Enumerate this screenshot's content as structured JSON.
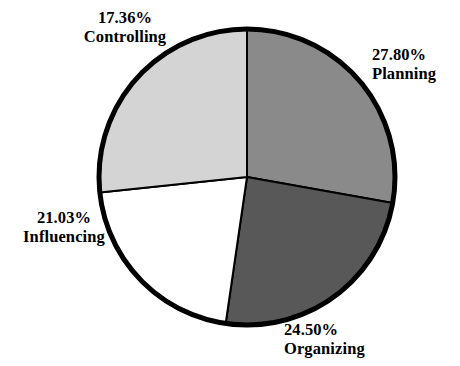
{
  "chart_data": {
    "type": "pie",
    "title": "",
    "xlabel": "",
    "ylabel": "",
    "legend": "none",
    "labels_position": "outside",
    "start_angle_deg": 0,
    "direction": "clockwise",
    "center": {
      "x": 247,
      "y": 177
    },
    "radius": 148,
    "outline_color": "#000000",
    "outline_width": 5,
    "background": "#ffffff",
    "categories": [
      "Planning",
      "Organizing",
      "Influencing",
      "Controlling"
    ],
    "values": [
      27.8,
      24.5,
      21.03,
      17.36
    ],
    "value_suffix": "%",
    "slice_colors": [
      "#8a8a8a",
      "#585858",
      "#ffffff",
      "#d4d4d4"
    ],
    "slices": [
      {
        "name": "Planning",
        "value": 27.8,
        "percent_label": "27.80%",
        "color": "#8a8a8a",
        "start_deg": 0.0,
        "end_deg": 100.08
      },
      {
        "name": "Organizing",
        "value": 24.5,
        "percent_label": "24.50%",
        "color": "#585858",
        "start_deg": 100.08,
        "end_deg": 188.28
      },
      {
        "name": "Influencing",
        "value": 21.03,
        "percent_label": "21.03%",
        "color": "#ffffff",
        "start_deg": 188.28,
        "end_deg": 264.0
      },
      {
        "name": "Controlling",
        "value": 17.36,
        "percent_label": "17.36%",
        "color": "#d4d4d4",
        "start_deg": 264.0,
        "end_deg": 360.0
      }
    ]
  },
  "labels": {
    "planning": {
      "percent": "27.80%",
      "name": "Planning"
    },
    "organizing": {
      "percent": "24.50%",
      "name": "Organizing"
    },
    "influencing": {
      "percent": "21.03%",
      "name": "Influencing"
    },
    "controlling": {
      "percent": "17.36%",
      "name": "Controlling"
    }
  }
}
